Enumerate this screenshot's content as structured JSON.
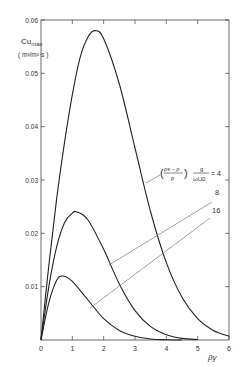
{
  "chart_data": {
    "type": "line",
    "title": "",
    "xlabel": "βy",
    "ylabel": "Cu_max (m³/m²·s)",
    "ylabel_main": "Cu",
    "ylabel_sub": "max",
    "ylabel_units": "( m³/m²·s )",
    "xlim": [
      0,
      6
    ],
    "ylim": [
      0,
      0.06
    ],
    "x_ticks": [
      0,
      1,
      2,
      3,
      4,
      5,
      6
    ],
    "y_ticks": [
      0.01,
      0.02,
      0.03,
      0.04,
      0.05,
      0.06
    ],
    "y_tick_labels": [
      "0.01",
      "0.02",
      "0.03",
      "0.04",
      "0.05",
      "0.06"
    ],
    "grid": false,
    "parameter_label": "((ρs − ρ)/ρ) · g/(ωU0)",
    "annotation_formula": {
      "paren_num": "ρs − ρ",
      "paren_den": "ρ",
      "frac_num": "g",
      "frac_den": "ωU0",
      "equals": "= 4"
    },
    "series": [
      {
        "name": "4",
        "label": "4",
        "peak_x": 1.72,
        "peak_y": 0.058,
        "x": [
          0,
          0.25,
          0.5,
          0.75,
          1.0,
          1.25,
          1.5,
          1.72,
          2.0,
          2.5,
          3.0,
          3.5,
          4.0,
          4.5,
          5.0,
          5.5,
          6.0
        ],
        "y": [
          0,
          0.014,
          0.0265,
          0.037,
          0.046,
          0.053,
          0.0568,
          0.058,
          0.0565,
          0.048,
          0.036,
          0.024,
          0.0145,
          0.008,
          0.004,
          0.0018,
          0.0007
        ]
      },
      {
        "name": "8",
        "label": "8",
        "peak_x": 1.15,
        "peak_y": 0.024,
        "x": [
          0,
          0.25,
          0.5,
          0.75,
          1.0,
          1.15,
          1.5,
          2.0,
          2.5,
          3.0,
          3.5,
          4.0,
          4.5,
          5.0
        ],
        "y": [
          0,
          0.01,
          0.0175,
          0.022,
          0.0238,
          0.024,
          0.0225,
          0.017,
          0.0105,
          0.0055,
          0.0025,
          0.001,
          0.0003,
          0.0001
        ]
      },
      {
        "name": "16",
        "label": "16",
        "peak_x": 0.7,
        "peak_y": 0.012,
        "x": [
          0,
          0.25,
          0.5,
          0.7,
          1.0,
          1.5,
          2.0,
          2.5,
          3.0,
          3.5,
          4.0,
          4.5
        ],
        "y": [
          0,
          0.007,
          0.0112,
          0.012,
          0.011,
          0.0075,
          0.004,
          0.0018,
          0.0007,
          0.0002,
          5e-05,
          0
        ]
      }
    ]
  },
  "colors": {
    "curve": "#222222",
    "axis": "#444444",
    "leader": "#777777",
    "text": "#333333"
  }
}
